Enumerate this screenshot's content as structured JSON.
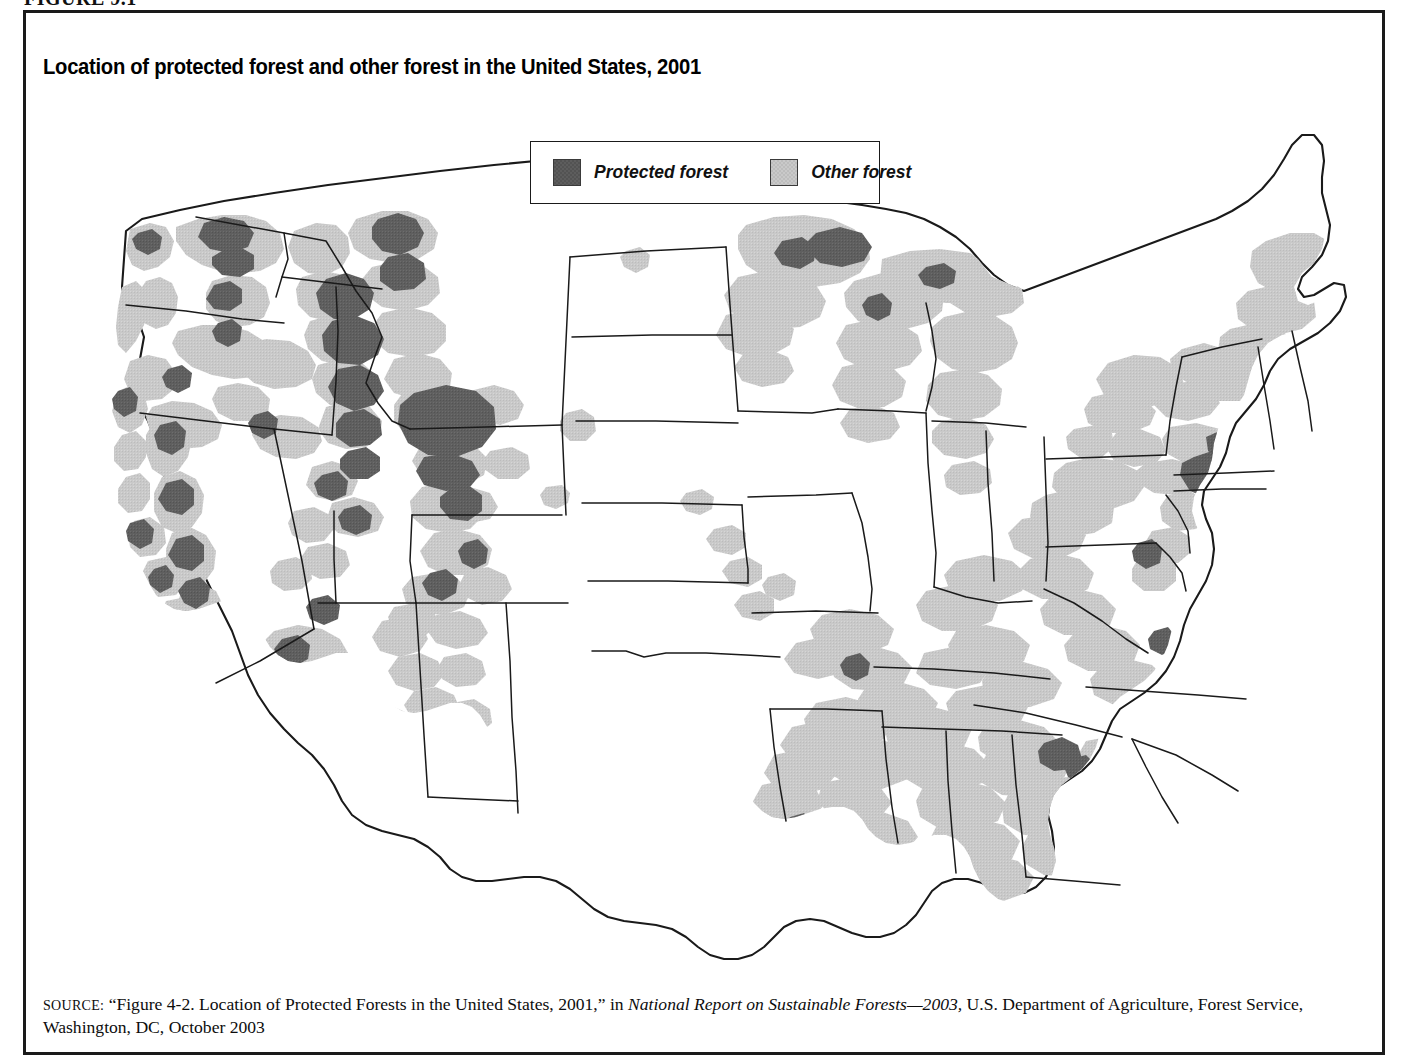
{
  "figure": {
    "label": "FIGURE 9.1",
    "title": "Location of protected forest and other forest in the United States, 2001"
  },
  "legend": {
    "items": [
      {
        "label": "Protected forest",
        "color": "#5d5d5d",
        "key": "protected"
      },
      {
        "label": "Other forest",
        "color": "#c6c6c6",
        "key": "other"
      }
    ]
  },
  "source": {
    "prefix": "SOURCE:",
    "text_before_italic": " “Figure 4-2. Location of Protected Forests in the United States, 2001,” in ",
    "italic_title": "National Report on Sustainable Forests—2003,",
    "text_after_italic": " U.S. Department of Agriculture, Forest Service, Washington, DC, October 2003"
  },
  "map": {
    "title": "United States forest cover map",
    "projection": "Albers conic, contiguous 48 states",
    "outline_color": "#1a1a1a",
    "background": "#ffffff",
    "categories": [
      {
        "name": "Protected forest",
        "fill": "#5d5d5d"
      },
      {
        "name": "Other forest",
        "fill": "#c6c6c6"
      },
      {
        "name": "Non-forest",
        "fill": "#ffffff"
      }
    ],
    "regions_with_heavy_forest": [
      "Pacific Northwest",
      "Northern Rockies",
      "Sierra Nevada",
      "Southern Appalachians",
      "Gulf Coastal Plain",
      "Northern New England",
      "Upper Great Lakes",
      "Ozarks and East Texas"
    ],
    "regions_with_little_forest": [
      "Great Plains",
      "Great Basin",
      "Corn Belt",
      "Central Valley of California",
      "West Texas"
    ],
    "notable_protected_areas": [
      "Olympic Peninsula",
      "North Cascades",
      "Frank Church / Selway-Bitterroot",
      "Yellowstone",
      "Sierra Nevada parks",
      "Adirondacks",
      "Great Smoky Mountains",
      "Boundary Waters"
    ]
  }
}
